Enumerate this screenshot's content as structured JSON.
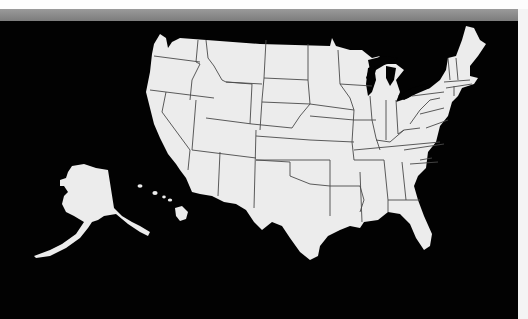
{
  "map": {
    "subject": "United States of America — state outline map",
    "regions": {
      "contiguous_us": "Lower 48 states with state borders",
      "alaska": "Alaska (inset, lower left)",
      "hawaii": "Hawaii (inset, lower left)"
    },
    "colors": {
      "land": "#ececec",
      "background": "#020202",
      "border": "#4a4a4a",
      "header_bar": "#8a8a8a",
      "page": "#ffffff"
    },
    "labels": []
  }
}
